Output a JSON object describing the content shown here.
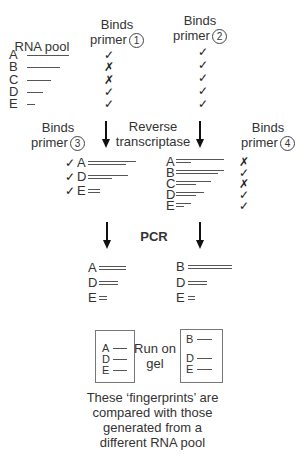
{
  "headers": {
    "rna_pool": "RNA pool",
    "primer1": {
      "line1": "Binds",
      "line2": "primer",
      "num": "1"
    },
    "primer2": {
      "line1": "Binds",
      "line2": "primer",
      "num": "2"
    },
    "primer3": {
      "line1": "Binds",
      "line2": "primer",
      "num": "3"
    },
    "primer4": {
      "line1": "Binds",
      "line2": "primer",
      "num": "4"
    },
    "reverse_transcriptase": {
      "line1": "Reverse",
      "line2": "transcriptase"
    },
    "pcr": "PCR",
    "run_on_gel": {
      "line1": "Run on",
      "line2": "gel"
    }
  },
  "rna_pool": [
    {
      "label": "A",
      "length": 42,
      "primer1": "✓",
      "primer2": "✓"
    },
    {
      "label": "B",
      "length": 33,
      "primer1": "✗",
      "primer2": "✓"
    },
    {
      "label": "C",
      "length": 24,
      "primer1": "✗",
      "primer2": "✓"
    },
    {
      "label": "D",
      "length": 16,
      "primer1": "✓",
      "primer2": "✓"
    },
    {
      "label": "E",
      "length": 8,
      "primer1": "✓",
      "primer2": "✓"
    }
  ],
  "primer3_selected": [
    {
      "mark": "✓",
      "label": "A"
    },
    {
      "mark": "✓",
      "label": "D"
    },
    {
      "mark": "✓",
      "label": "E"
    }
  ],
  "rt_products": [
    {
      "label": "A",
      "primer4": "✗"
    },
    {
      "label": "B",
      "primer4": "✓"
    },
    {
      "label": "C",
      "primer4": "✗"
    },
    {
      "label": "D",
      "primer4": "✓"
    },
    {
      "label": "E",
      "primer4": "✓"
    }
  ],
  "pcr_left": [
    {
      "label": "A"
    },
    {
      "label": "D"
    },
    {
      "label": "E"
    }
  ],
  "pcr_right": [
    {
      "label": "B"
    },
    {
      "label": "D"
    },
    {
      "label": "E"
    }
  ],
  "gel_left": [
    {
      "label": "A"
    },
    {
      "label": "D"
    },
    {
      "label": "E"
    }
  ],
  "gel_right": [
    {
      "label": "B"
    },
    {
      "label": "D"
    },
    {
      "label": "E"
    }
  ],
  "caption": {
    "line1": "These ‘fingerprints’ are",
    "line2": "compared with those",
    "line3": "generated from a",
    "line4": "different RNA pool"
  }
}
